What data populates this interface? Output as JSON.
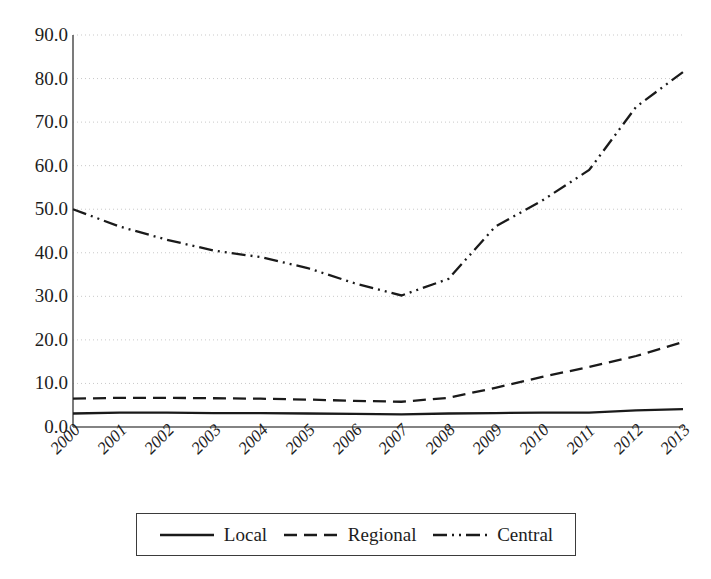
{
  "chart_data": {
    "type": "line",
    "title": "",
    "subtitle": "",
    "xlabel": "",
    "ylabel": "",
    "categories": [
      "2000",
      "2001",
      "2002",
      "2003",
      "2004",
      "2005",
      "2006",
      "2007",
      "2008",
      "2009",
      "2010",
      "2011",
      "2012",
      "2013"
    ],
    "ylim": [
      0.0,
      90.0
    ],
    "y_ticks": [
      "0.0",
      "10.0",
      "20.0",
      "30.0",
      "40.0",
      "50.0",
      "60.0",
      "70.0",
      "80.0",
      "90.0"
    ],
    "y_tick_values": [
      0,
      10,
      20,
      30,
      40,
      50,
      60,
      70,
      80,
      90
    ],
    "grid": "horizontal-dotted",
    "legend_position": "bottom",
    "series": [
      {
        "name": "Local",
        "line_style": "solid",
        "color": "#1a1a1a",
        "values": [
          3.1,
          3.3,
          3.3,
          3.2,
          3.2,
          3.1,
          3.0,
          2.9,
          3.1,
          3.2,
          3.3,
          3.3,
          3.8,
          4.1
        ]
      },
      {
        "name": "Regional",
        "line_style": "dashed",
        "color": "#1a1a1a",
        "values": [
          6.5,
          6.7,
          6.7,
          6.6,
          6.5,
          6.3,
          6.0,
          5.8,
          6.7,
          9.0,
          11.5,
          13.8,
          16.3,
          19.5
        ]
      },
      {
        "name": "Central",
        "line_style": "dash-dot-dot",
        "color": "#1a1a1a",
        "values": [
          50.0,
          46.0,
          43.0,
          40.5,
          39.0,
          36.5,
          33.0,
          30.2,
          34.0,
          46.0,
          52.0,
          59.0,
          73.5,
          81.5
        ]
      }
    ]
  },
  "legend": {
    "items": [
      {
        "label": "Local",
        "sample": "solid-line-sample"
      },
      {
        "label": "Regional",
        "sample": "dashed-line-sample"
      },
      {
        "label": "Central",
        "sample": "dash-dot-dot-line-sample"
      }
    ]
  },
  "colors": {
    "ink": "#1a1a1a",
    "axis": "#5a5a5a",
    "grid": "#c9c9c9",
    "background": "#ffffff"
  }
}
